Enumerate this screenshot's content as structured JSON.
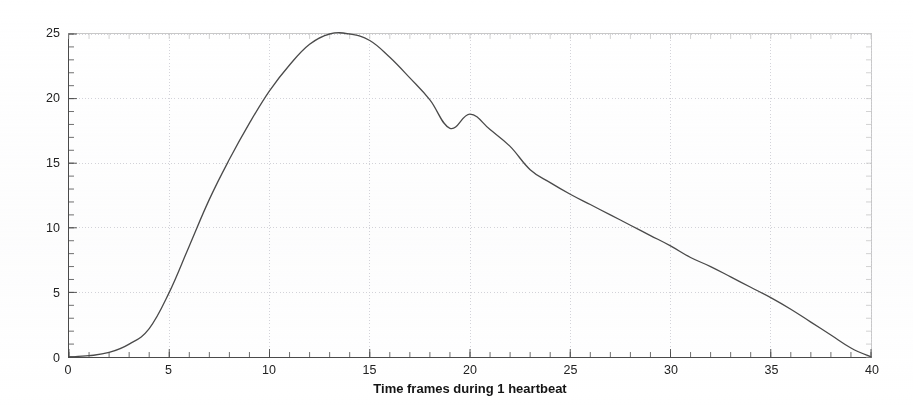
{
  "chart_data": {
    "type": "line",
    "title": "",
    "xlabel": "Time frames during 1 heartbeat",
    "ylabel": "Vessel lumen increase %",
    "xlim": [
      0,
      40
    ],
    "ylim": [
      0,
      25
    ],
    "xticks": [
      0,
      5,
      10,
      15,
      20,
      25,
      30,
      35,
      40
    ],
    "yticks": [
      0,
      5,
      10,
      15,
      20,
      25
    ],
    "xtick_labels": [
      "0",
      "5",
      "10",
      "15",
      "20",
      "25",
      "30",
      "35",
      "40"
    ],
    "ytick_labels": [
      "0",
      "5",
      "10",
      "15",
      "20",
      "25"
    ],
    "grid": true,
    "grid_style": "dotted",
    "legend": null,
    "line_color": "#4a4a4a",
    "line_width": 1.3,
    "series": [
      {
        "name": "Vessel lumen increase",
        "x": [
          0,
          1,
          2,
          3,
          4,
          5,
          6,
          7,
          8,
          9,
          10,
          11,
          12,
          13,
          14,
          15,
          16,
          17,
          18,
          19,
          20,
          21,
          22,
          23,
          24,
          25,
          26,
          27,
          28,
          29,
          30,
          31,
          32,
          33,
          34,
          35,
          36,
          37,
          38,
          39,
          40
        ],
        "values": [
          0.0,
          0.1,
          0.35,
          1.0,
          2.2,
          5.0,
          8.6,
          12.2,
          15.3,
          18.1,
          20.6,
          22.6,
          24.2,
          25.0,
          25.0,
          24.5,
          23.2,
          21.6,
          19.9,
          17.7,
          18.8,
          17.6,
          16.3,
          14.5,
          13.5,
          12.6,
          11.8,
          11.0,
          10.2,
          9.4,
          8.6,
          7.7,
          7.0,
          6.2,
          5.4,
          4.6,
          3.7,
          2.7,
          1.7,
          0.7,
          0.0
        ]
      }
    ]
  },
  "figure": {
    "background_color": "#ffffff",
    "axis_color": "#4a4a4a",
    "grid_color": "#cfcfd6",
    "text_color": "#141414"
  }
}
